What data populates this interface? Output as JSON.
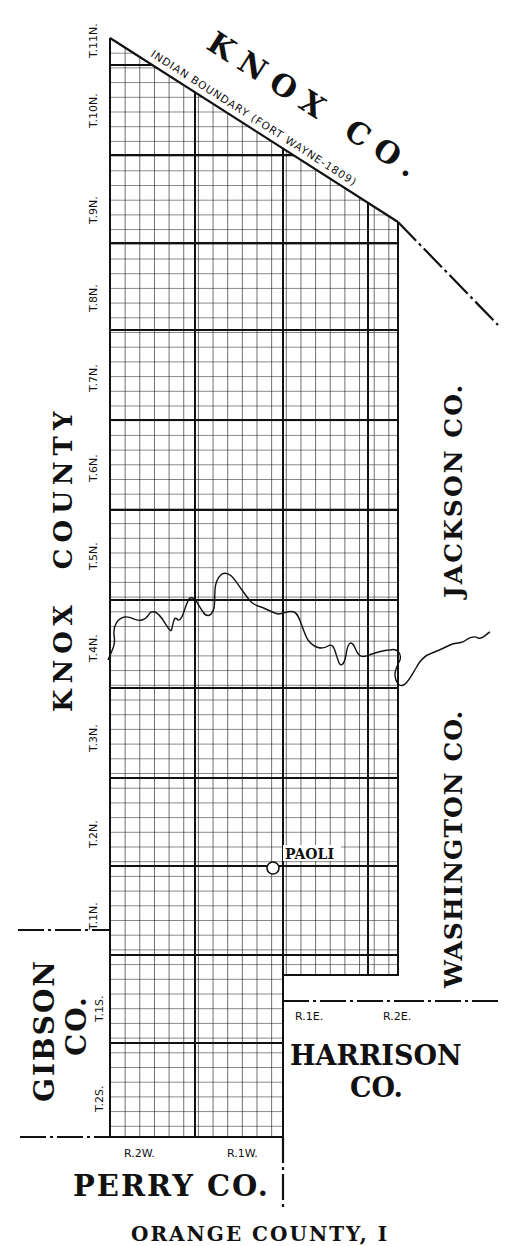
{
  "map": {
    "type": "township survey map",
    "subject_county": "Orange County",
    "caption_partial": "ORANGE COUNTY, I"
  },
  "county_labels": {
    "knox_co_top": "KNOX CO.",
    "knox_county_left": "KNOX  COUNTY",
    "jackson_co": "JACKSON CO.",
    "washington_co": "WASHINGTON CO.",
    "gibson_co_line1": "GIBSON",
    "gibson_co_line2": "CO.",
    "harrison_co_line1": "HARRISON",
    "harrison_co_line2": "CO.",
    "perry_co": "PERRY CO."
  },
  "boundary_label": "INDIAN  BOUNDARY  (FORT WAYNE-1809)",
  "township_labels": [
    "T.11N.",
    "T.10N.",
    "T.9N.",
    "T.8N.",
    "T.7N.",
    "T.6N.",
    "T.5N.",
    "T.4N.",
    "T.3N.",
    "T.2N.",
    "T.1N.",
    "T.1S.",
    "T.2S."
  ],
  "range_labels": [
    "R.2W.",
    "R.1W.",
    "R.1E.",
    "R.2E."
  ],
  "town": {
    "name": "PAOLI",
    "symbol": "circle"
  },
  "colors": {
    "ink": "#111111",
    "paper": "#ffffff"
  }
}
